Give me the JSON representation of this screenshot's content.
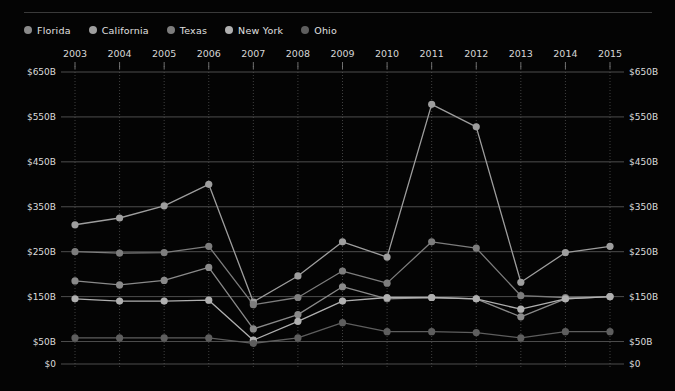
{
  "legend": {
    "position": "top-left",
    "items": [
      {
        "label": "Florida",
        "color": "#8a8a8a"
      },
      {
        "label": "California",
        "color": "#9e9e9e"
      },
      {
        "label": "Texas",
        "color": "#7d7d7d"
      },
      {
        "label": "New York",
        "color": "#b0b0b0"
      },
      {
        "label": "Ohio",
        "color": "#5e5e5e"
      }
    ]
  },
  "axes": {
    "y_ticks": [
      "$0",
      "$50B",
      "$150B",
      "$250B",
      "$350B",
      "$450B",
      "$550B",
      "$650B"
    ],
    "x_ticks": [
      "2003",
      "2004",
      "2005",
      "2006",
      "2007",
      "2008",
      "2009",
      "2010",
      "2011",
      "2012",
      "2013",
      "2014",
      "2015"
    ]
  },
  "chart_data": {
    "type": "line",
    "title": "",
    "subtitle": "",
    "xlabel": "",
    "ylabel": "",
    "ylim": [
      0,
      650
    ],
    "ytick_values": [
      0,
      50,
      150,
      250,
      350,
      450,
      550,
      650
    ],
    "ytick_labels": [
      "$0",
      "$50B",
      "$150B",
      "$250B",
      "$350B",
      "$450B",
      "$550B",
      "$650B"
    ],
    "grid": true,
    "legend_position": "top-left",
    "categories": [
      "2003",
      "2004",
      "2005",
      "2006",
      "2007",
      "2008",
      "2009",
      "2010",
      "2011",
      "2012",
      "2013",
      "2014",
      "2015"
    ],
    "series": [
      {
        "name": "Florida",
        "color": "#8a8a8a",
        "values": [
          185,
          176,
          186,
          215,
          78,
          110,
          172,
          145,
          148,
          145,
          105,
          145,
          150
        ]
      },
      {
        "name": "California",
        "color": "#9e9e9e",
        "values": [
          310,
          325,
          352,
          400,
          138,
          196,
          272,
          238,
          578,
          528,
          182,
          248,
          262
        ]
      },
      {
        "name": "Texas",
        "color": "#7d7d7d",
        "values": [
          250,
          247,
          248,
          262,
          132,
          148,
          207,
          180,
          272,
          258,
          152,
          148,
          150
        ]
      },
      {
        "name": "New York",
        "color": "#b0b0b0",
        "values": [
          145,
          140,
          140,
          142,
          53,
          95,
          140,
          148,
          148,
          145,
          122,
          145,
          150
        ]
      },
      {
        "name": "Ohio",
        "color": "#5e5e5e",
        "values": [
          58,
          58,
          58,
          58,
          46,
          58,
          92,
          72,
          72,
          70,
          58,
          72,
          72
        ]
      }
    ]
  }
}
